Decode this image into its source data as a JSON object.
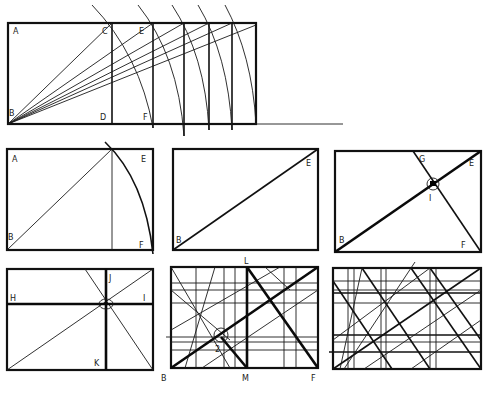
{
  "panels": [
    {
      "id": "root-rectangles-construction",
      "labels": [
        "A",
        "C",
        "E",
        "B",
        "D",
        "F"
      ],
      "description": "Square ABDC with diagonals from B swung as arcs to generate successive root rectangles"
    },
    {
      "id": "root2-rectangle",
      "labels": [
        "A",
        "E",
        "B",
        "F"
      ]
    },
    {
      "id": "diagonal",
      "labels": [
        "E",
        "B"
      ]
    },
    {
      "id": "reciprocal-diagonal",
      "labels": [
        "G",
        "E",
        "I",
        "B",
        "F"
      ]
    },
    {
      "id": "eye-point-division",
      "labels": [
        "J",
        "H",
        "I",
        "K"
      ]
    },
    {
      "id": "complex-harmonic-grid",
      "labels": [
        "L",
        "2",
        "B",
        "M",
        "F"
      ]
    },
    {
      "id": "full-harmonic-grid",
      "labels": []
    }
  ]
}
